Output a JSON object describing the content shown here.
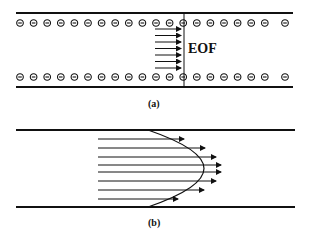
{
  "figure_a": {
    "label": "(a)",
    "flow_label": "EOF",
    "charge_symbol": "negative-charge",
    "charges_per_wall": 20,
    "arrow_count": 7
  },
  "figure_b": {
    "label": "(b)",
    "arrow_count": 8,
    "profile": "parabolic"
  },
  "colors": {
    "stroke": "#111111",
    "background": "#ffffff"
  }
}
